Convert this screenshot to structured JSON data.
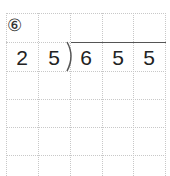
{
  "problem": {
    "number_label": "⑥",
    "divisor": [
      "2",
      "5"
    ],
    "dividend": [
      "6",
      "5",
      "5"
    ]
  }
}
